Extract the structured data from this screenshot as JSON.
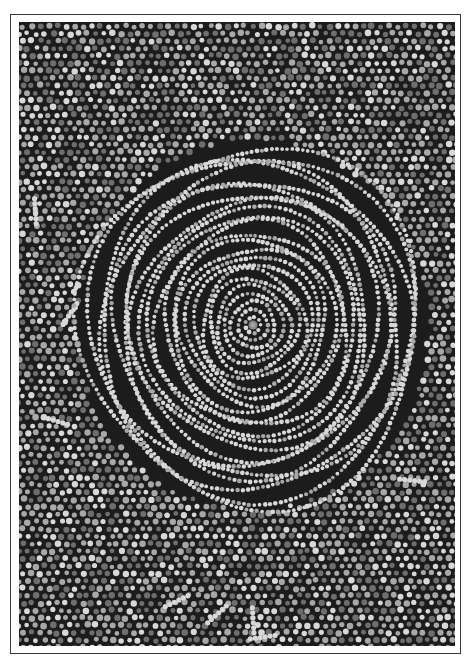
{
  "artwork": {
    "title": "",
    "style": "dot painting, concentric circles",
    "colors": {
      "background": "#1c1c1c",
      "dot_light": "#d8d8d8",
      "dot_mid": "#a8a8a8",
      "dot_dark": "#6e6e6e",
      "center": "#8a8a8a",
      "frame_line": "#3a3a3a",
      "mat": "#ffffff"
    },
    "center": {
      "x": 234,
      "y": 303
    },
    "inner_radius_x": 175,
    "inner_radius_y": 185,
    "ring_spacing": 7.5,
    "inner_dot_radius": 2.1,
    "outer_dot_radius": 2.9,
    "outer_dot_spacing": 8.5
  }
}
